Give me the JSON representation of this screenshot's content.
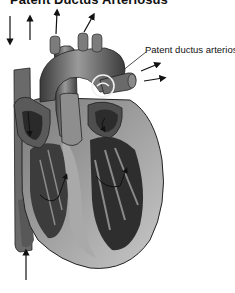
{
  "title": "Patent Ductus Arteriosus",
  "labels": {
    "pda": "Patent ductus arteriosus"
  },
  "arrows": [
    {
      "name": "svc-inflow-arrow",
      "direction": "down"
    },
    {
      "name": "pulmonary-outflow-arrow-1",
      "direction": "up"
    },
    {
      "name": "aortic-outflow-arrow-1",
      "direction": "up"
    },
    {
      "name": "aortic-outflow-arrow-2",
      "direction": "up-right"
    },
    {
      "name": "pulmonary-artery-arrow-1",
      "direction": "right"
    },
    {
      "name": "pulmonary-artery-arrow-2",
      "direction": "right"
    },
    {
      "name": "ivc-inflow-arrow",
      "direction": "up"
    }
  ],
  "colors": {
    "background": "#ffffff",
    "ink": "#111111",
    "heart_dark": "#2e2e2e",
    "heart_mid": "#6e6e6e",
    "heart_light": "#b5b5b5",
    "highlight_circle": "#f2f2f2"
  }
}
